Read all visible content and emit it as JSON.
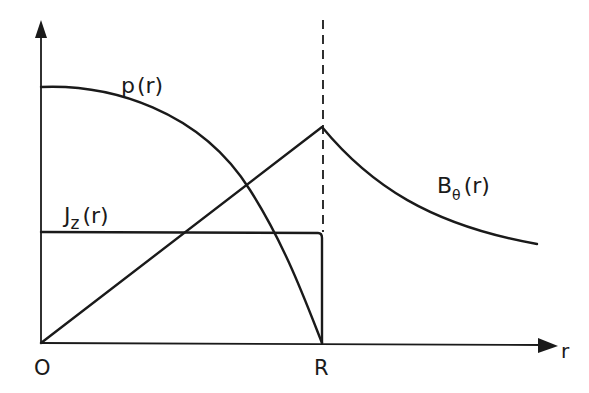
{
  "diagram": {
    "axes": {
      "x_label": "r",
      "origin_label": "O",
      "boundary_label": "R"
    },
    "curves": {
      "pressure": {
        "label_main": "p",
        "label_sub": "",
        "label_arg": "(r)",
        "shape": "parabolic, max at r=0, zero at r=R"
      },
      "current_density": {
        "label_main": "J",
        "label_sub": "z",
        "label_arg": "(r)",
        "shape": "uniform for r<R, drops to zero at r=R"
      },
      "magnetic_field": {
        "label_main": "B",
        "label_sub": "θ",
        "label_arg": "(r)",
        "shape": "linear rise to r=R, then ~1/r decay"
      }
    },
    "boundary_marker": "dashed vertical line at r = R"
  }
}
